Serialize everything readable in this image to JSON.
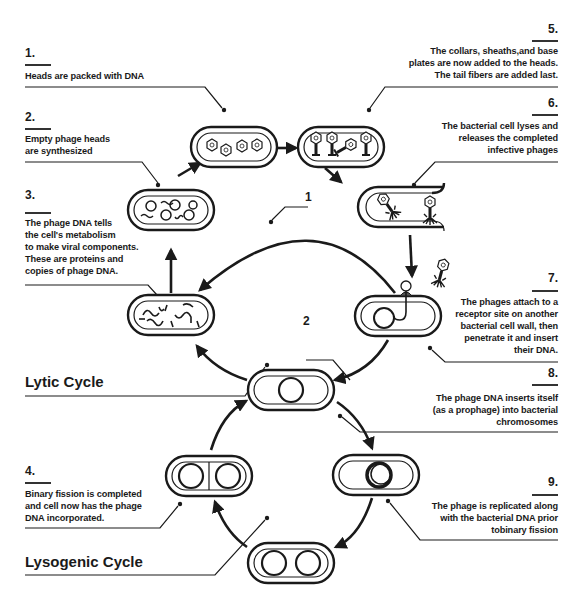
{
  "diagram": {
    "cycles": {
      "lytic": "Lytic Cycle",
      "lysogenic": "Lysogenic Cycle"
    },
    "markers": {
      "m1": "1",
      "m2": "2"
    },
    "steps": [
      {
        "number": "1.",
        "text": [
          "Heads are packed with DNA"
        ]
      },
      {
        "number": "2.",
        "text": [
          "Empty phage heads",
          "are synthesized"
        ]
      },
      {
        "number": "3.",
        "text": [
          "The phage DNA tells",
          "the cell's metabolism",
          "to make viral components.",
          "These are proteins and",
          "copies of phage DNA."
        ]
      },
      {
        "number": "4.",
        "text": [
          "Binary fission is completed",
          "and cell now has the phage",
          "DNA incorporated."
        ]
      },
      {
        "number": "5.",
        "text": [
          "The collars, sheaths,and base",
          "plates are now added to the heads.",
          "The tail fibers are added last."
        ]
      },
      {
        "number": "6.",
        "text": [
          "The bacterial cell lyses and",
          "releases the completed",
          "infective phages"
        ]
      },
      {
        "number": "7.",
        "text": [
          "The phages attach to a",
          "receptor site on another",
          "bacterial cell wall, then",
          "penetrate it and insert",
          "their DNA."
        ]
      },
      {
        "number": "8.",
        "text": [
          "The phage DNA inserts itself",
          "(as a prophage) into bacterial",
          "chromosomes"
        ]
      },
      {
        "number": "9.",
        "text": [
          "The phage is replicated along",
          "with the bacterial DNA prior",
          "tobinary fission"
        ]
      }
    ],
    "colors": {
      "ink": "#1a1a1a",
      "background": "#ffffff"
    }
  }
}
